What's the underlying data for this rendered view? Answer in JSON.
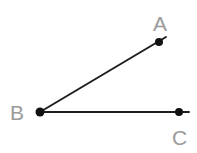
{
  "diagram": {
    "type": "angle",
    "name": "angle ABC",
    "colors": {
      "line": "#1e1e1e",
      "point": "#111111",
      "label": "#9a9a9a",
      "background": "#ffffff"
    },
    "points": [
      {
        "id": "A",
        "label": "A",
        "x": 159,
        "y": 42,
        "label_x": 153,
        "label_y": 31
      },
      {
        "id": "B",
        "label": "B",
        "x": 40,
        "y": 112,
        "label_x": 10,
        "label_y": 120
      },
      {
        "id": "C",
        "label": "C",
        "x": 179,
        "y": 112,
        "label_x": 172,
        "label_y": 145
      }
    ],
    "rays": [
      {
        "from": "B",
        "through": "A",
        "x1": 40,
        "y1": 112,
        "x2": 166,
        "y2": 37
      },
      {
        "from": "B",
        "through": "C",
        "x1": 40,
        "y1": 112,
        "x2": 189,
        "y2": 112
      }
    ]
  }
}
